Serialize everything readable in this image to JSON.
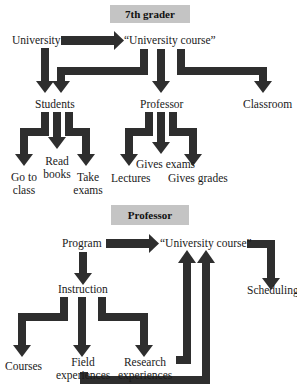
{
  "sections": [
    {
      "header": "7th grader",
      "nodes": {
        "root": "University",
        "course": "“University course”",
        "students": "Students",
        "professor": "Professor",
        "classroom": "Classroom",
        "go_to_class_1": "Go to",
        "go_to_class_2": "class",
        "read_books_1": "Read",
        "read_books_2": "books",
        "take_exams_1": "Take",
        "take_exams_2": "exams",
        "lectures": "Lectures",
        "gives_exams": "Gives exams",
        "gives_grades": "Gives grades"
      },
      "edges": [
        [
          "University",
          "University course"
        ],
        [
          "University",
          "Students"
        ],
        [
          "University course",
          "Students"
        ],
        [
          "University course",
          "Professor"
        ],
        [
          "University course",
          "Classroom"
        ],
        [
          "Students",
          "Go to class"
        ],
        [
          "Students",
          "Read books"
        ],
        [
          "Students",
          "Take exams"
        ],
        [
          "Professor",
          "Lectures"
        ],
        [
          "Professor",
          "Gives exams"
        ],
        [
          "Professor",
          "Gives grades"
        ]
      ]
    },
    {
      "header": "Professor",
      "nodes": {
        "program": "Program",
        "course": "“University course”",
        "instruction": "Instruction",
        "scheduling": "Scheduling",
        "courses": "Courses",
        "field_1": "Field",
        "field_2": "experiences",
        "research_1": "Research",
        "research_2": "experiences"
      },
      "edges": [
        [
          "Program",
          "University course"
        ],
        [
          "Program",
          "Instruction"
        ],
        [
          "University course",
          "Scheduling"
        ],
        [
          "Instruction",
          "Courses"
        ],
        [
          "Instruction",
          "Field experiences"
        ],
        [
          "Instruction",
          "Research experiences"
        ],
        [
          "Research experiences",
          "University course"
        ],
        [
          "Field experiences",
          "University course"
        ]
      ]
    }
  ],
  "colors": {
    "arrow": "#2e2e2e",
    "header_bg": "#c4c4c4"
  }
}
